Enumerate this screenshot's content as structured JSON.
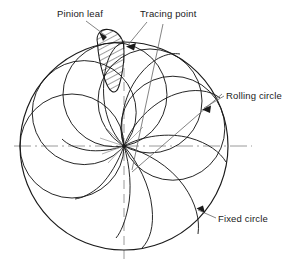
{
  "figure": {
    "background_color": "#ffffff",
    "line_color": "#1a1a1a",
    "centerline_color": "#9a9a9a",
    "leader_color": "#6e6e6e",
    "hatch_color": "#1a1a1a"
  },
  "labels": {
    "pinion_leaf": "Pinion leaf",
    "tracing_point": "Tracing point",
    "rolling_circle": "Rolling circle",
    "fixed_circle": "Fixed circle"
  },
  "geometry": {
    "fixed_circle": {
      "cx": 124,
      "cy": 146,
      "r": 104
    },
    "node_point": {
      "x": 124,
      "y": 146
    },
    "rolling_circle_radius": 52,
    "rolling_circle_count": 5,
    "rolling_circle_angles_deg": [
      180,
      140,
      100,
      60,
      20
    ],
    "trace_curve_count": 9,
    "horizontal_centerline": {
      "x1": 14,
      "y1": 146,
      "x2": 252,
      "y2": 146
    },
    "vertical_centerline": {
      "x1": 124,
      "y1": 40,
      "x2": 124,
      "y2": 263
    }
  },
  "label_positions": {
    "pinion_leaf": {
      "text_x": 57,
      "text_y": 17,
      "leader_from_x": 86,
      "leader_from_y": 21,
      "arrow_x": 107,
      "arrow_y": 37
    },
    "tracing_point": {
      "text_x": 140,
      "text_y": 17,
      "leader_from_x": 147,
      "leader_from_y": 22,
      "arrow_x": 127,
      "arrow_y": 46
    },
    "rolling_circle": {
      "text_x": 226,
      "text_y": 99,
      "leader_from_x": 224,
      "leader_from_y": 96,
      "arrow_x": 203,
      "arrow_y": 109
    },
    "fixed_circle": {
      "text_x": 218,
      "text_y": 222,
      "leader_from_x": 216,
      "leader_from_y": 218,
      "arrow_x": 197,
      "arrow_y": 209
    }
  }
}
